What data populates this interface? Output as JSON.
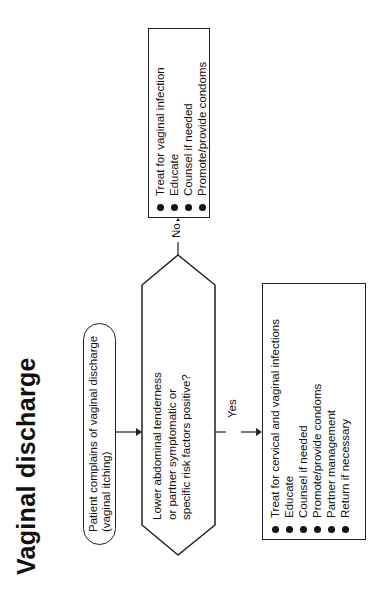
{
  "page": {
    "title": "Vaginal discharge",
    "orientation": "rotated 90 degrees counter-clockwise"
  },
  "flowchart": {
    "start": {
      "line1": "Patient complains of vaginal discharge",
      "line2": "(vaginal itching)"
    },
    "decision": {
      "line1": "Lower abdominal tenderness",
      "line2": "or partner symptomatic or",
      "line3": "specific risk factors positive?"
    },
    "branches": {
      "no_label": "No",
      "yes_label": "Yes"
    },
    "no_box": {
      "items": [
        "Treat for vaginal infection",
        "Educate",
        "Counsel if needed",
        "Promote/provide condoms"
      ]
    },
    "yes_box": {
      "items": [
        "Treat for cervical and vaginal infections",
        "Educate",
        "Counsel if needed",
        "Promote/provide condoms",
        "Partner management",
        "Return if necessary"
      ]
    }
  },
  "colors": {
    "ink": "#111111",
    "background": "#ffffff"
  }
}
